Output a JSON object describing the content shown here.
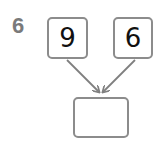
{
  "question": {
    "number": "6",
    "addends": [
      "9",
      "6"
    ],
    "answer": ""
  },
  "colors": {
    "label": "#7a7a7a",
    "box_border": "#8c8c8c",
    "arrow": "#7f7f7f",
    "digit": "#111111"
  }
}
